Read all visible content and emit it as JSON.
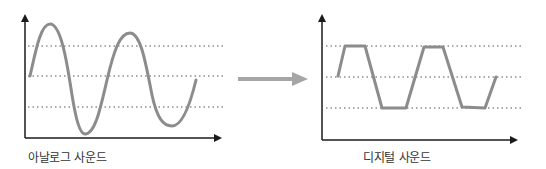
{
  "analog": {
    "label": "아날로그 사운드",
    "wave_color": "#8c8c8c",
    "grid_lines_y": [
      46,
      76,
      107
    ]
  },
  "digital": {
    "label": "디지털 사운드",
    "wave_color": "#8c8c8c",
    "grid_lines_y": [
      46,
      77,
      108
    ],
    "points": [
      [
        338,
        76
      ],
      [
        345,
        46
      ],
      [
        365,
        46
      ],
      [
        382,
        108
      ],
      [
        406,
        108
      ],
      [
        424,
        47
      ],
      [
        443,
        47
      ],
      [
        462,
        107
      ],
      [
        485,
        108
      ],
      [
        496,
        77
      ]
    ]
  },
  "arrow": {
    "color": "#a6a6a6",
    "direction": "right"
  },
  "axis_color": "#1a1a1a"
}
